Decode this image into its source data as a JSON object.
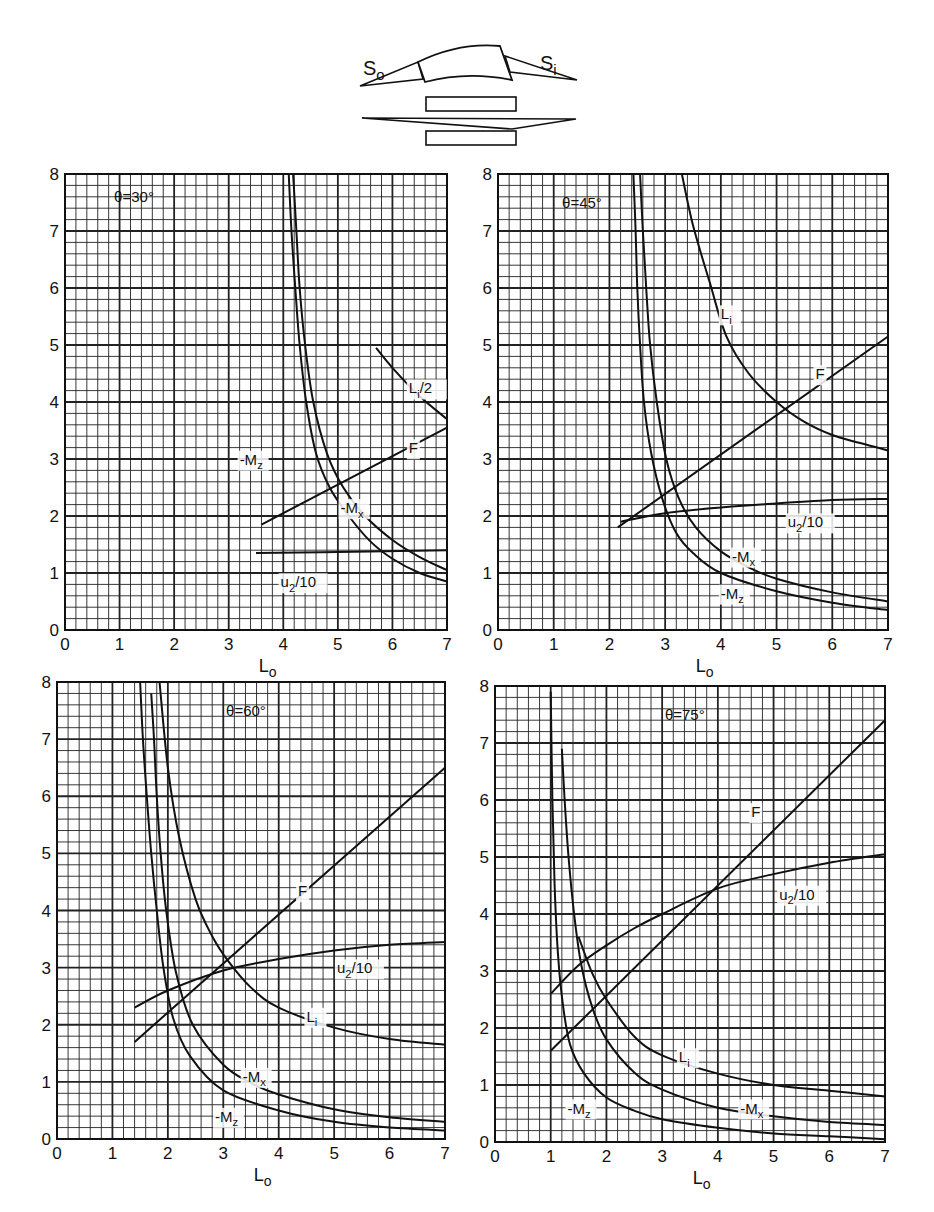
{
  "schematic": {
    "label_left": "S",
    "label_left_sub": "o",
    "label_right": "S",
    "label_right_sub": "i"
  },
  "chart_data": [
    {
      "type": "line",
      "title": "θ=30°",
      "xlabel": "Lo",
      "ylabel": "",
      "xlim": [
        0,
        7
      ],
      "ylim": [
        0,
        8
      ],
      "xticks": [
        "0",
        "1",
        "2",
        "3",
        "4",
        "5",
        "6",
        "7"
      ],
      "yticks": [
        "0",
        "1",
        "2",
        "3",
        "4",
        "5",
        "6",
        "7",
        "8"
      ],
      "grid": true,
      "frame": {
        "left": 65,
        "top": 174,
        "right": 447,
        "bottom": 630
      },
      "title_pos": [
        0.9,
        7.6
      ],
      "series": [
        {
          "name": "-Mz",
          "label_pos": [
            3.2,
            2.9
          ],
          "points": [
            [
              4.1,
              8
            ],
            [
              4.15,
              7
            ],
            [
              4.22,
              6
            ],
            [
              4.3,
              5
            ],
            [
              4.42,
              4
            ],
            [
              4.6,
              3.1
            ],
            [
              4.85,
              2.5
            ],
            [
              5.2,
              2.0
            ],
            [
              5.6,
              1.55
            ],
            [
              6.0,
              1.25
            ],
            [
              6.5,
              1.0
            ],
            [
              7.0,
              0.85
            ]
          ]
        },
        {
          "name": "-Mx",
          "label_pos": [
            5.05,
            2.05
          ],
          "points": [
            [
              4.18,
              8
            ],
            [
              4.24,
              7
            ],
            [
              4.3,
              6
            ],
            [
              4.4,
              5
            ],
            [
              4.55,
              4
            ],
            [
              4.8,
              3.1
            ],
            [
              5.1,
              2.5
            ],
            [
              5.5,
              2.0
            ],
            [
              6.0,
              1.58
            ],
            [
              6.5,
              1.28
            ],
            [
              7.0,
              1.05
            ]
          ]
        },
        {
          "name": "F",
          "label_pos": [
            6.3,
            3.1
          ],
          "points": [
            [
              3.6,
              1.85
            ],
            [
              7.0,
              3.55
            ]
          ]
        },
        {
          "name": "u2/10",
          "label_pos": [
            3.95,
            0.75
          ],
          "points": [
            [
              3.5,
              1.35
            ],
            [
              5.0,
              1.37
            ],
            [
              7.0,
              1.4
            ]
          ]
        },
        {
          "name": "Li/2",
          "label_pos": [
            6.3,
            4.15
          ],
          "points": [
            [
              5.7,
              4.95
            ],
            [
              6.0,
              4.6
            ],
            [
              6.5,
              4.1
            ],
            [
              7.0,
              3.7
            ]
          ]
        }
      ]
    },
    {
      "type": "line",
      "title": "θ=45°",
      "xlabel": "Lo",
      "ylabel": "",
      "xlim": [
        0,
        7
      ],
      "ylim": [
        0,
        8
      ],
      "xticks": [
        "0",
        "1",
        "2",
        "3",
        "4",
        "5",
        "6",
        "7"
      ],
      "yticks": [
        "0",
        "1",
        "2",
        "3",
        "4",
        "5",
        "6",
        "7",
        "8"
      ],
      "grid": true,
      "frame": {
        "left": 498,
        "top": 174,
        "right": 888,
        "bottom": 630
      },
      "title_pos": [
        1.15,
        7.5
      ],
      "series": [
        {
          "name": "-Mz",
          "label_pos": [
            4.0,
            0.55
          ],
          "points": [
            [
              2.43,
              8
            ],
            [
              2.47,
              7
            ],
            [
              2.5,
              6
            ],
            [
              2.55,
              5
            ],
            [
              2.62,
              4
            ],
            [
              2.75,
              3.1
            ],
            [
              2.95,
              2.3
            ],
            [
              3.2,
              1.7
            ],
            [
              3.5,
              1.35
            ],
            [
              4.0,
              1.0
            ],
            [
              5.0,
              0.68
            ],
            [
              6.0,
              0.48
            ],
            [
              7.0,
              0.35
            ]
          ]
        },
        {
          "name": "-Mx",
          "label_pos": [
            4.2,
            1.2
          ],
          "points": [
            [
              2.55,
              8
            ],
            [
              2.6,
              7
            ],
            [
              2.66,
              6
            ],
            [
              2.73,
              5
            ],
            [
              2.85,
              4
            ],
            [
              3.02,
              3.0
            ],
            [
              3.25,
              2.3
            ],
            [
              3.55,
              1.8
            ],
            [
              4.0,
              1.38
            ],
            [
              4.5,
              1.1
            ],
            [
              5.0,
              0.9
            ],
            [
              6.0,
              0.66
            ],
            [
              7.0,
              0.5
            ]
          ]
        },
        {
          "name": "F",
          "label_pos": [
            5.7,
            4.4
          ],
          "points": [
            [
              2.15,
              1.8
            ],
            [
              7.0,
              5.15
            ]
          ]
        },
        {
          "name": "u2/10",
          "label_pos": [
            5.2,
            1.8
          ],
          "points": [
            [
              2.2,
              1.9
            ],
            [
              3.0,
              2.05
            ],
            [
              4.0,
              2.15
            ],
            [
              5.0,
              2.22
            ],
            [
              6.0,
              2.28
            ],
            [
              7.0,
              2.3
            ]
          ]
        },
        {
          "name": "Li",
          "label_pos": [
            4.0,
            5.45
          ],
          "points": [
            [
              3.3,
              8
            ],
            [
              3.5,
              7.1
            ],
            [
              3.8,
              6.1
            ],
            [
              4.1,
              5.15
            ],
            [
              4.5,
              4.5
            ],
            [
              5.0,
              4.0
            ],
            [
              5.5,
              3.65
            ],
            [
              6.0,
              3.42
            ],
            [
              6.5,
              3.28
            ],
            [
              7.0,
              3.15
            ]
          ]
        }
      ]
    },
    {
      "type": "line",
      "title": "θ=60°",
      "xlabel": "Lo",
      "ylabel": "",
      "xlim": [
        0,
        7
      ],
      "ylim": [
        0,
        8
      ],
      "xticks": [
        "0",
        "1",
        "2",
        "3",
        "4",
        "5",
        "6",
        "7"
      ],
      "yticks": [
        "0",
        "1",
        "2",
        "3",
        "4",
        "5",
        "6",
        "7",
        "8"
      ],
      "grid": true,
      "frame": {
        "left": 57,
        "top": 682,
        "right": 445,
        "bottom": 1139
      },
      "title_pos": [
        3.05,
        7.5
      ],
      "series": [
        {
          "name": "-Mz",
          "label_pos": [
            2.85,
            0.3
          ],
          "points": [
            [
              1.5,
              8
            ],
            [
              1.55,
              7
            ],
            [
              1.62,
              6
            ],
            [
              1.7,
              5
            ],
            [
              1.8,
              4
            ],
            [
              1.92,
              3.0
            ],
            [
              2.1,
              2.1
            ],
            [
              2.4,
              1.45
            ],
            [
              3.0,
              0.85
            ],
            [
              4.0,
              0.5
            ],
            [
              5.0,
              0.3
            ],
            [
              6.0,
              0.2
            ],
            [
              7.0,
              0.15
            ]
          ]
        },
        {
          "name": "-Mx",
          "label_pos": [
            3.35,
            1.0
          ],
          "points": [
            [
              1.7,
              7.8
            ],
            [
              1.75,
              7
            ],
            [
              1.8,
              6
            ],
            [
              1.87,
              5
            ],
            [
              1.97,
              4
            ],
            [
              2.15,
              2.9
            ],
            [
              2.45,
              2.0
            ],
            [
              3.0,
              1.3
            ],
            [
              3.5,
              0.98
            ],
            [
              4.0,
              0.78
            ],
            [
              5.0,
              0.52
            ],
            [
              6.0,
              0.38
            ],
            [
              7.0,
              0.3
            ]
          ]
        },
        {
          "name": "F",
          "label_pos": [
            4.35,
            4.25
          ],
          "points": [
            [
              1.4,
              1.7
            ],
            [
              7.0,
              6.5
            ]
          ]
        },
        {
          "name": "u2/10",
          "label_pos": [
            5.05,
            2.9
          ],
          "points": [
            [
              1.4,
              2.3
            ],
            [
              2.0,
              2.6
            ],
            [
              3.0,
              2.95
            ],
            [
              4.0,
              3.15
            ],
            [
              5.0,
              3.3
            ],
            [
              6.0,
              3.4
            ],
            [
              7.0,
              3.45
            ]
          ]
        },
        {
          "name": "Li",
          "label_pos": [
            4.5,
            2.05
          ],
          "points": [
            [
              1.85,
              8
            ],
            [
              2.0,
              6.5
            ],
            [
              2.2,
              5.3
            ],
            [
              2.5,
              4.2
            ],
            [
              2.8,
              3.55
            ],
            [
              3.1,
              3.1
            ],
            [
              3.5,
              2.65
            ],
            [
              4.0,
              2.3
            ],
            [
              5.0,
              1.95
            ],
            [
              6.0,
              1.75
            ],
            [
              7.0,
              1.65
            ]
          ]
        }
      ]
    },
    {
      "type": "line",
      "title": "θ=75°",
      "xlabel": "Lo",
      "ylabel": "",
      "xlim": [
        0,
        7
      ],
      "ylim": [
        0,
        8
      ],
      "xticks": [
        "0",
        "1",
        "2",
        "3",
        "4",
        "5",
        "6",
        "7"
      ],
      "yticks": [
        "0",
        "1",
        "2",
        "3",
        "4",
        "5",
        "6",
        "7",
        "8"
      ],
      "grid": true,
      "frame": {
        "left": 495,
        "top": 686,
        "right": 885,
        "bottom": 1142
      },
      "title_pos": [
        3.05,
        7.5
      ],
      "series": [
        {
          "name": "-Mz",
          "label_pos": [
            1.3,
            0.5
          ],
          "points": [
            [
              1.0,
              7.9
            ],
            [
              1.03,
              6
            ],
            [
              1.07,
              4.5
            ],
            [
              1.13,
              3.3
            ],
            [
              1.22,
              2.4
            ],
            [
              1.35,
              1.7
            ],
            [
              1.6,
              1.2
            ],
            [
              2.0,
              0.78
            ],
            [
              2.5,
              0.55
            ],
            [
              3.0,
              0.4
            ],
            [
              4.0,
              0.25
            ],
            [
              5.0,
              0.15
            ],
            [
              6.0,
              0.1
            ],
            [
              7.0,
              0.05
            ]
          ]
        },
        {
          "name": "-Mx",
          "label_pos": [
            4.4,
            0.5
          ],
          "points": [
            [
              1.2,
              6.9
            ],
            [
              1.25,
              6
            ],
            [
              1.32,
              5
            ],
            [
              1.42,
              4
            ],
            [
              1.55,
              3.1
            ],
            [
              1.75,
              2.35
            ],
            [
              2.0,
              1.8
            ],
            [
              2.5,
              1.22
            ],
            [
              3.0,
              0.92
            ],
            [
              4.0,
              0.6
            ],
            [
              5.0,
              0.45
            ],
            [
              6.0,
              0.35
            ],
            [
              7.0,
              0.3
            ]
          ]
        },
        {
          "name": "F",
          "label_pos": [
            4.6,
            5.7
          ],
          "points": [
            [
              1.0,
              1.6
            ],
            [
              7.0,
              7.4
            ]
          ]
        },
        {
          "name": "u2/10",
          "label_pos": [
            5.1,
            4.25
          ],
          "points": [
            [
              1.0,
              2.6
            ],
            [
              1.5,
              3.1
            ],
            [
              2.0,
              3.45
            ],
            [
              2.5,
              3.75
            ],
            [
              3.0,
              4.0
            ],
            [
              4.0,
              4.45
            ],
            [
              5.0,
              4.7
            ],
            [
              6.0,
              4.9
            ],
            [
              7.0,
              5.05
            ]
          ]
        },
        {
          "name": "Li",
          "label_pos": [
            3.3,
            1.4
          ],
          "points": [
            [
              1.5,
              3.6
            ],
            [
              1.75,
              2.95
            ],
            [
              2.0,
              2.5
            ],
            [
              2.5,
              1.85
            ],
            [
              3.0,
              1.52
            ],
            [
              4.0,
              1.2
            ],
            [
              5.0,
              1.0
            ],
            [
              6.0,
              0.9
            ],
            [
              7.0,
              0.8
            ]
          ]
        }
      ]
    }
  ]
}
